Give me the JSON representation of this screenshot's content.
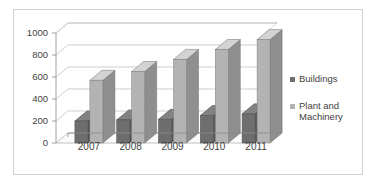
{
  "chart_data": {
    "type": "bar",
    "title": "",
    "subtitle": "",
    "xlabel": "",
    "ylabel": "",
    "categories": [
      "2007",
      "2008",
      "2009",
      "2010",
      "2011"
    ],
    "series": [
      {
        "name": "Buildings",
        "color": "#6e6e6e",
        "values": [
          200,
          210,
          215,
          250,
          265
        ]
      },
      {
        "name": "Plant and Machinery",
        "color": "#b3b3b3",
        "values": [
          570,
          650,
          760,
          850,
          940
        ]
      }
    ],
    "ylim": [
      0,
      1000
    ],
    "ytick_labels": [
      "0",
      "200",
      "400",
      "600",
      "800",
      "1000"
    ],
    "ytick_values": [
      0,
      200,
      400,
      600,
      800,
      1000
    ],
    "grid": true,
    "grid_axis": "y",
    "legend_position": "right",
    "style": "3d-column",
    "background": "#ffffff",
    "border_color": "#d2d2d2",
    "axis_color": "#9a9a9a",
    "grid_color": "#b9b9b9",
    "text_color": "#3f3f3f"
  },
  "legend": {
    "items": [
      {
        "label": "Buildings",
        "marker": "square-dark"
      },
      {
        "label": "Plant and",
        "label2": "Machinery",
        "marker": "square-light"
      }
    ]
  }
}
